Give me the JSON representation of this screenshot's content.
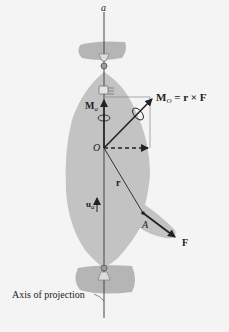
{
  "diagram": {
    "axis_label_top": "a",
    "moment_axis_label": "M",
    "moment_axis_sub": "a",
    "moment_o_label": "M",
    "moment_o_sub": "O",
    "moment_o_eq": " = r × F",
    "origin_label": "O",
    "position_label": "r",
    "unit_vector_label": "u",
    "unit_vector_sub": "a",
    "point_label": "A",
    "force_label": "F",
    "axis_caption": "Axis of projection"
  },
  "colors": {
    "background": "#f4f4f4",
    "body_fill": "#c3c3c3",
    "bracket_fill": "#b5b5b5",
    "ink": "#222222",
    "line": "#555555"
  }
}
